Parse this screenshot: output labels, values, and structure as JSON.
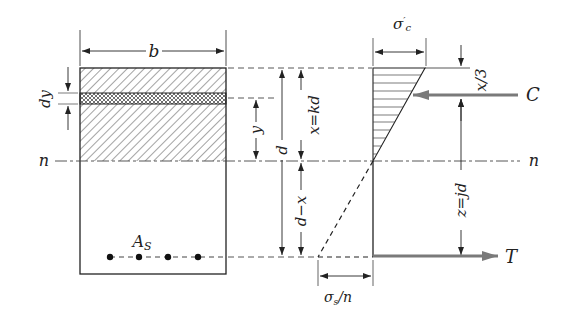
{
  "diagram": {
    "section": {
      "width_label": "b",
      "strip_label": "dy",
      "strip_distance_label": "y",
      "steel_label": "As",
      "steel_label_main": "A",
      "steel_label_sub": "S",
      "bar_count": 4
    },
    "dimensions": {
      "effective_depth": "d",
      "neutral_axis_depth": "x=kd",
      "below_neutral": "d−x",
      "lever_arm": "z=jd",
      "compression_offset": "x/3"
    },
    "neutral_axis": {
      "left_label": "n",
      "right_label": "n"
    },
    "stress": {
      "concrete_label": "σ′c",
      "concrete_main": "σ",
      "concrete_prime": "′",
      "concrete_sub": "c",
      "steel_label": "σs/n",
      "steel_main": "σ",
      "steel_sub": "s",
      "steel_div": "/n"
    },
    "forces": {
      "compression": "C",
      "tension": "T"
    },
    "colors": {
      "line": "#222222",
      "force_arrow": "#7a7a7a",
      "hatch": "#333333"
    }
  }
}
